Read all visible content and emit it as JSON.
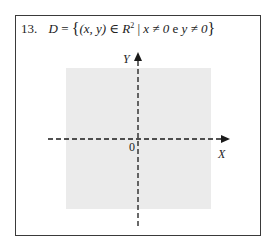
{
  "problem": {
    "number": "13.",
    "set_name": "D",
    "equals": "=",
    "brace_open": "{",
    "brace_close": "}",
    "pair": "(x, y)",
    "element_of": "∈",
    "space": "R",
    "exponent": "2",
    "separator": "|",
    "condition_1": "x ≠ 0",
    "connector": "e",
    "condition_2": "y ≠ 0"
  },
  "diagram": {
    "x_axis_label": "X",
    "y_axis_label": "Y",
    "origin_label": "0",
    "region_color": "#ebebeb",
    "axis_color": "#1a1a1a",
    "frame_color": "#3a3a3a"
  }
}
